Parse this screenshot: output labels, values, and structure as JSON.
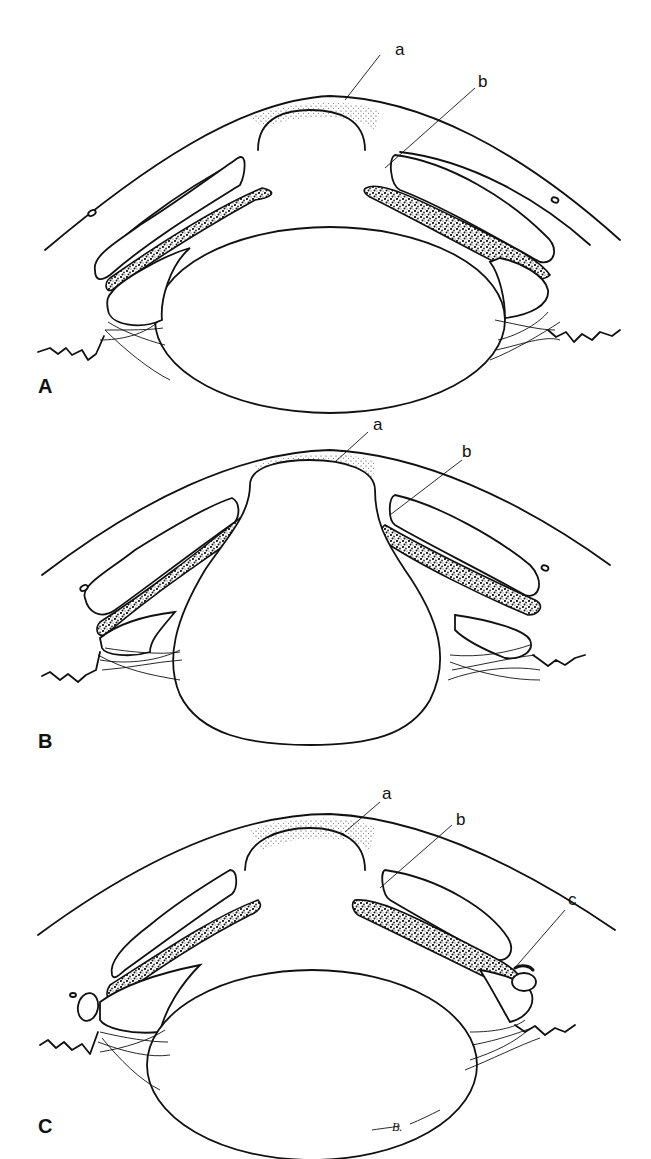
{
  "figure": {
    "panels": [
      {
        "id": "A",
        "panel_label": "A",
        "callouts": [
          {
            "letter": "a"
          },
          {
            "letter": "b"
          }
        ]
      },
      {
        "id": "B",
        "panel_label": "B",
        "callouts": [
          {
            "letter": "a"
          },
          {
            "letter": "b"
          }
        ]
      },
      {
        "id": "C",
        "panel_label": "C",
        "callouts": [
          {
            "letter": "a"
          },
          {
            "letter": "b"
          },
          {
            "letter": "c"
          }
        ]
      }
    ],
    "signature": "B."
  },
  "colors": {
    "line": "#111111",
    "background": "#ffffff"
  }
}
